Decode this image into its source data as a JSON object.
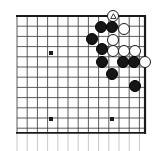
{
  "figure": {
    "kind": "go-board-diagram",
    "board_size": 19,
    "region": "upper right corner",
    "width_px": 162,
    "height_px": 151
  },
  "board": {
    "line_color": "#3f3f3f",
    "edge_color": "#1a1a1a",
    "background_color": "#ffffff",
    "star_point_color": "#1a1a1a",
    "cell_px": 10.2,
    "origin_x_px": 17,
    "origin_y_px": 16,
    "cols_visible": 13,
    "rows_visible": 12,
    "top_edge_row": 0,
    "right_edge_col": 12.55,
    "bottom_line_row": 11.45,
    "star_points": [
      {
        "x_px": 51,
        "y_px": 53
      },
      {
        "x_px": 51,
        "y_px": 119
      },
      {
        "x_px": 112,
        "y_px": 119
      }
    ]
  },
  "stones": {
    "black_color": "#161616",
    "white_color": "#ffffff",
    "outline_color": "#1a1a1a",
    "radius_px": 6.4,
    "black": [
      {
        "x_px": 101,
        "y_px": 27,
        "label": "b1"
      },
      {
        "x_px": 112,
        "y_px": 27,
        "label": "b2"
      },
      {
        "x_px": 92,
        "y_px": 39,
        "label": "b3"
      },
      {
        "x_px": 102,
        "y_px": 49,
        "label": "b4"
      },
      {
        "x_px": 102,
        "y_px": 62,
        "label": "b5"
      },
      {
        "x_px": 123,
        "y_px": 62,
        "label": "b6"
      },
      {
        "x_px": 134,
        "y_px": 62,
        "label": "b7"
      },
      {
        "x_px": 112,
        "y_px": 74,
        "label": "b8"
      },
      {
        "x_px": 135,
        "y_px": 86,
        "label": "b9"
      }
    ],
    "white": [
      {
        "x_px": 113,
        "y_px": 16,
        "label": "w-marked",
        "marked": true,
        "mark": "triangle"
      },
      {
        "x_px": 124,
        "y_px": 29,
        "label": "w1"
      },
      {
        "x_px": 113,
        "y_px": 40,
        "label": "w2"
      },
      {
        "x_px": 113,
        "y_px": 51,
        "label": "w3"
      },
      {
        "x_px": 124,
        "y_px": 51,
        "label": "w4"
      },
      {
        "x_px": 135,
        "y_px": 51,
        "label": "w5"
      },
      {
        "x_px": 145,
        "y_px": 62,
        "label": "w6"
      }
    ]
  },
  "marks": {
    "triangle_color": "#1a1a1a",
    "triangle_label": "triangle-marked-white-stone"
  }
}
